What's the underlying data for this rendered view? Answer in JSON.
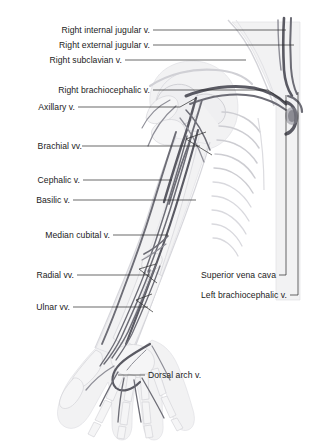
{
  "figure": {
    "style": "grayscale anatomical illustration",
    "accent_color": "#6d6d76",
    "label_color": "#1b1b1b",
    "leader_color": "#2a2a2a",
    "background_color": "#ffffff"
  },
  "labels_left": [
    {
      "id": "right-internal-jugular-vein",
      "text": "Right internal jugular v.",
      "x": 150,
      "y": 33,
      "leader": "M153,30 L286,30"
    },
    {
      "id": "right-external-jugular-vein",
      "text": "Right external jugular v.",
      "x": 150,
      "y": 48,
      "leader": "M153,45 L294,45"
    },
    {
      "id": "right-subclavian-vein",
      "text": "Right subclavian v.",
      "x": 122,
      "y": 63,
      "leader": "M125,60 L246,60"
    },
    {
      "id": "right-brachiocephalic-vein",
      "text": "Right brachiocephalic v.",
      "x": 150,
      "y": 93,
      "leader": "M153,90 L268,90 L286,103"
    },
    {
      "id": "axillary-vein",
      "text": "Axillary v.",
      "x": 75,
      "y": 110,
      "leader": "M78,107 L180,107 L196,98"
    },
    {
      "id": "brachial-veins",
      "text": "Brachial vv.",
      "x": 82,
      "y": 149,
      "leader": "M82,146 L200,146 M186,139 L206,132 M186,139 L212,155"
    },
    {
      "id": "cephalic-vein",
      "text": "Cephalic v.",
      "x": 80,
      "y": 183,
      "leader": "M83,180 L172,180"
    },
    {
      "id": "basilic-vein",
      "text": "Basilic v.",
      "x": 70,
      "y": 203,
      "leader": "M73,200 L196,200"
    },
    {
      "id": "median-cubital-vein",
      "text": "Median cubital v.",
      "x": 110,
      "y": 238,
      "leader": "M113,235 L168,235"
    },
    {
      "id": "radial-veins",
      "text": "Radial vv.",
      "x": 74,
      "y": 278,
      "leader": "M77,275 L150,275 M139,269 L156,264 M139,269 L157,283"
    },
    {
      "id": "ulnar-veins",
      "text": "Ulnar vv.",
      "x": 70,
      "y": 310,
      "leader": "M73,307 L148,307 M136,300 L152,294 M136,300 L153,312"
    },
    {
      "id": "dorsal-arch-vein",
      "text": "Dorsal arch v.",
      "x": 148,
      "y": 378,
      "leader": "M145,375 L118,375"
    }
  ],
  "labels_right": [
    {
      "id": "superior-vena-cava",
      "text": "Superior vena cava",
      "x": 276,
      "y": 278,
      "leader": "M279,275 L286,275 L286,95"
    },
    {
      "id": "left-brachiocephalic-vein",
      "text": "Left brachiocephalic v.",
      "x": 287,
      "y": 298,
      "leader": "M290,295 L298,295 L298,92"
    }
  ]
}
